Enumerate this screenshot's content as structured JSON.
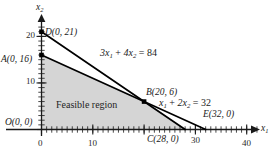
{
  "figure": {
    "region_label": "Feasible region",
    "axis_labels": {
      "x": "x₁",
      "y": "x₂"
    },
    "axis_label_x_base": "x",
    "axis_label_x_sub": "1",
    "axis_label_y_base": "x",
    "axis_label_y_sub": "2",
    "colors": {
      "fill": "#d4d4d4",
      "line": "#000000",
      "axis": "#1a1a1a",
      "text": "#1a1a1a"
    }
  },
  "chart_data": {
    "type": "line",
    "title": "Feasible region",
    "xlabel": "x₁",
    "ylabel": "x₂",
    "xlim": [
      0,
      44
    ],
    "ylim": [
      0,
      24
    ],
    "grid": false,
    "legend": "none",
    "x_ticks": [
      0,
      10,
      20,
      30,
      40
    ],
    "x_tick_labels": [
      "0",
      "10",
      "",
      "30",
      "40"
    ],
    "x_minor_tick_step": 1,
    "y_ticks": [
      0,
      10,
      20
    ],
    "y_tick_labels": [
      "",
      "10",
      "20"
    ],
    "y_minor_tick_step": 1,
    "constraints": [
      {
        "label": "3x₁ + 4x₂ = 84",
        "label_parts": [
          "3",
          "x",
          "1",
          " + 4",
          "x",
          "2",
          " = 84"
        ],
        "coefficients": {
          "a": 3,
          "b": 4,
          "c": 84
        },
        "endpoints": [
          {
            "x": 0,
            "y": 21
          },
          {
            "x": 28,
            "y": 0
          }
        ],
        "label_position": {
          "x": 14.3,
          "y": 16.4
        }
      },
      {
        "label": "x₁ + 2x₂ = 32",
        "label_parts": [
          "",
          "x",
          "1",
          " + 2",
          "x",
          "2",
          " = 32"
        ],
        "coefficients": {
          "a": 1,
          "b": 2,
          "c": 32
        },
        "endpoints": [
          {
            "x": 0,
            "y": 16
          },
          {
            "x": 32,
            "y": 0
          }
        ],
        "label_position": {
          "x": 26.2,
          "y": 5.2
        }
      }
    ],
    "feasible_polygon": [
      {
        "x": 0,
        "y": 0
      },
      {
        "x": 0,
        "y": 16
      },
      {
        "x": 20,
        "y": 6
      },
      {
        "x": 28,
        "y": 0
      }
    ],
    "points": [
      {
        "id": "O",
        "label": "O(0, 0)",
        "name": "O",
        "coords": "(0, 0)",
        "x": 0,
        "y": 0,
        "marker": false
      },
      {
        "id": "A",
        "label": "A(0, 16)",
        "name": "A",
        "coords": "(0, 16)",
        "x": 0,
        "y": 16,
        "marker": true
      },
      {
        "id": "D",
        "label": "D(0, 21)",
        "name": "D",
        "coords": "(0, 21)",
        "x": 0,
        "y": 21,
        "marker": true
      },
      {
        "id": "B",
        "label": "B(20, 6)",
        "name": "B",
        "coords": "(20, 6)",
        "x": 20,
        "y": 6,
        "marker": true
      },
      {
        "id": "C",
        "label": "C(28, 0)",
        "name": "C",
        "coords": "(28, 0)",
        "x": 28,
        "y": 0,
        "marker": false
      },
      {
        "id": "E",
        "label": "E(32, 0)",
        "name": "E",
        "coords": "(32, 0)",
        "x": 32,
        "y": 0,
        "marker": false
      }
    ],
    "annotations": [
      {
        "text": "Feasible region",
        "x": 8.5,
        "y": 4.3
      }
    ]
  },
  "labels": {
    "point_O": "O(0, 0)",
    "point_A": "A(0, 16)",
    "point_D": "D(0, 21)",
    "point_B": "B(20, 6)",
    "point_C": "C(28, 0)",
    "point_E": "E(32, 0)",
    "eq1": "3x₁ + 4x₂ = 84",
    "eq2": "x₁ + 2x₂ = 32",
    "feasible": "Feasible region",
    "tick_x_0": "0",
    "tick_x_10": "10",
    "tick_x_30": "30",
    "tick_x_40": "40",
    "tick_y_10": "10",
    "tick_y_20": "20"
  }
}
